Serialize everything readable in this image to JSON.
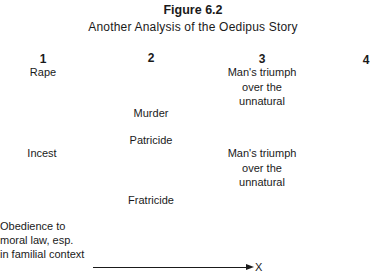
{
  "figure": {
    "label": "Figure 6.2",
    "title": "Another Analysis of the Oedipus Story"
  },
  "columns": [
    {
      "number": "1",
      "entries": [
        "Rape",
        "Incest"
      ]
    },
    {
      "number": "2",
      "entries": [
        "Murder",
        "Patricide",
        "Fratricide"
      ]
    },
    {
      "number": "3",
      "entries": [
        [
          "Man's triumph",
          "over the",
          "unnatural"
        ],
        [
          "Man's triumph",
          "over the",
          "unnatural"
        ]
      ]
    },
    {
      "number": "4",
      "entries": []
    }
  ],
  "axis": {
    "source_label": [
      "Obedience to",
      "moral law, esp.",
      "in familial context"
    ],
    "target_label": "X"
  }
}
